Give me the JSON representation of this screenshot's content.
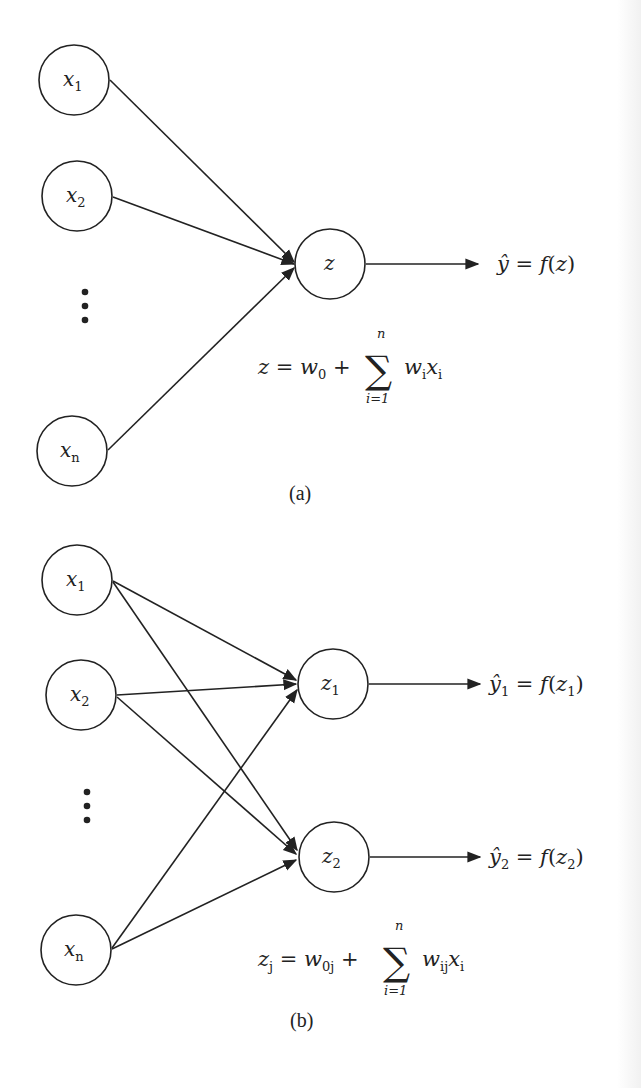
{
  "panel_a": {
    "inputs": [
      {
        "var": "x",
        "sub": "1"
      },
      {
        "var": "x",
        "sub": "2"
      },
      {
        "var": "x",
        "sub": "n"
      }
    ],
    "ellipsis": "⋮",
    "neuron": {
      "var": "z",
      "sub": ""
    },
    "output": {
      "hat_var": "ŷ",
      "sub": "",
      "eq": " = ",
      "func": "f",
      "arg_var": "z",
      "arg_sub": ""
    },
    "formula": {
      "lhs": "z",
      "lhs_sub": "",
      "eq": " = ",
      "w0": "w",
      "w0_sub": "0",
      "plus": " + ",
      "sum_symbol": "∑",
      "sum_upper": "n",
      "sum_lower": "i=1",
      "term_w": "w",
      "term_w_sub": "i",
      "term_x": "x",
      "term_x_sub": "i"
    },
    "caption": "(a)"
  },
  "panel_b": {
    "inputs": [
      {
        "var": "x",
        "sub": "1"
      },
      {
        "var": "x",
        "sub": "2"
      },
      {
        "var": "x",
        "sub": "n"
      }
    ],
    "ellipsis": "⋮",
    "neurons": [
      {
        "var": "z",
        "sub": "1"
      },
      {
        "var": "z",
        "sub": "2"
      }
    ],
    "outputs": [
      {
        "hat_var": "ŷ",
        "sub": "1",
        "eq": " = ",
        "func": "f",
        "arg_var": "z",
        "arg_sub": "1"
      },
      {
        "hat_var": "ŷ",
        "sub": "2",
        "eq": " = ",
        "func": "f",
        "arg_var": "z",
        "arg_sub": "2"
      }
    ],
    "formula": {
      "lhs": "z",
      "lhs_sub": "j",
      "eq": " = ",
      "w0": "w",
      "w0_sub": "0j",
      "plus": " + ",
      "sum_symbol": "∑",
      "sum_upper": "n",
      "sum_lower": "i=1",
      "term_w": "w",
      "term_w_sub": "ij",
      "term_x": "x",
      "term_x_sub": "i"
    },
    "caption": "(b)"
  },
  "colors": {
    "stroke": "#222222",
    "background": "#ffffff"
  }
}
